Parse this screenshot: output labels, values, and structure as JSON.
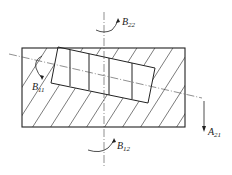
{
  "diagram": {
    "labels": {
      "b22": {
        "base": "B",
        "sub": "22"
      },
      "b11": {
        "base": "B",
        "sub": "11"
      },
      "b12": {
        "base": "B",
        "sub": "12"
      },
      "a21": {
        "base": "A",
        "sub": "21"
      }
    },
    "colors": {
      "line": "#222222",
      "hatch": "#444444",
      "background": "#ffffff"
    }
  }
}
